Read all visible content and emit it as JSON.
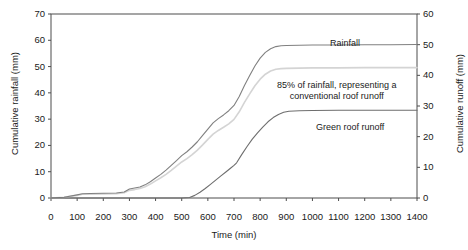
{
  "chart_data": {
    "type": "line",
    "title": "",
    "xlabel": "Time (min)",
    "ylabel": "Cumulative rainfall (mm)",
    "ylabel_right": "Cumulative runoff (mm)",
    "xlim": [
      0,
      1400
    ],
    "ylim": [
      0,
      70
    ],
    "ylim_right": [
      0,
      60
    ],
    "xticks": [
      0,
      100,
      200,
      300,
      400,
      500,
      600,
      700,
      800,
      900,
      1000,
      1100,
      1200,
      1300,
      1400
    ],
    "yticks": [
      0,
      10,
      20,
      30,
      40,
      50,
      60,
      70
    ],
    "yticks_right": [
      0,
      10,
      20,
      30,
      40,
      50,
      60
    ],
    "grid": false,
    "legend_position": "inline-annotations",
    "series": [
      {
        "name": "Rainfall",
        "color": "#808080",
        "axis": "left",
        "x": [
          0,
          50,
          100,
          120,
          150,
          200,
          250,
          280,
          300,
          320,
          340,
          360,
          380,
          400,
          420,
          440,
          460,
          480,
          500,
          520,
          540,
          560,
          580,
          600,
          620,
          640,
          660,
          680,
          700,
          720,
          740,
          760,
          780,
          800,
          820,
          840,
          860,
          880,
          900,
          950,
          1000,
          1100,
          1200,
          1300,
          1400
        ],
        "y": [
          0,
          0.3,
          1.2,
          1.6,
          1.7,
          1.8,
          1.9,
          2.3,
          3.4,
          3.8,
          4.2,
          5.0,
          6.2,
          7.6,
          9.0,
          10.6,
          12.4,
          14.2,
          16.1,
          17.6,
          19.4,
          21.4,
          23.8,
          26.2,
          28.6,
          30.2,
          31.6,
          33.2,
          35.2,
          38.6,
          42.8,
          46.6,
          50.2,
          53.2,
          55.4,
          56.8,
          57.6,
          57.9,
          58.0,
          58.1,
          58.2,
          58.2,
          58.3,
          58.3,
          58.4
        ]
      },
      {
        "name": "85% of rainfall, representing a conventional roof runoff",
        "color": "#d4d4d4",
        "axis": "left",
        "x": [
          0,
          50,
          100,
          120,
          150,
          200,
          250,
          280,
          300,
          320,
          340,
          360,
          380,
          400,
          420,
          440,
          460,
          480,
          500,
          520,
          540,
          560,
          580,
          600,
          620,
          640,
          660,
          680,
          700,
          720,
          740,
          760,
          780,
          800,
          820,
          840,
          860,
          880,
          900,
          950,
          1000,
          1100,
          1200,
          1300,
          1400
        ],
        "y": [
          0,
          0.25,
          1.0,
          1.4,
          1.45,
          1.5,
          1.6,
          2.0,
          2.9,
          3.2,
          3.6,
          4.3,
          5.3,
          6.5,
          7.7,
          9.0,
          10.5,
          12.1,
          13.7,
          15.0,
          16.5,
          18.2,
          20.2,
          22.3,
          24.3,
          25.7,
          26.9,
          28.2,
          29.9,
          32.8,
          36.4,
          39.6,
          42.7,
          45.2,
          47.1,
          48.3,
          49.0,
          49.2,
          49.3,
          49.4,
          49.5,
          49.5,
          49.6,
          49.6,
          49.6
        ]
      },
      {
        "name": "Green roof runoff",
        "color": "#6e6e6e",
        "axis": "left",
        "x": [
          0,
          100,
          200,
          300,
          400,
          500,
          530,
          550,
          570,
          590,
          610,
          630,
          650,
          670,
          690,
          700,
          710,
          730,
          750,
          770,
          790,
          810,
          830,
          850,
          870,
          890,
          910,
          950,
          1000,
          1100,
          1200,
          1300,
          1400
        ],
        "y": [
          0,
          0,
          0,
          0,
          0,
          0,
          0.2,
          1.0,
          2.2,
          3.6,
          5.2,
          6.8,
          8.4,
          10.0,
          11.6,
          12.4,
          13.4,
          16.6,
          19.6,
          22.4,
          24.8,
          27.0,
          29.0,
          30.6,
          31.8,
          32.6,
          33.0,
          33.2,
          33.3,
          33.4,
          33.4,
          33.4,
          33.4
        ]
      }
    ],
    "annotations": [
      {
        "text": "Rainfall",
        "x_px": 345,
        "y_px": 44
      },
      {
        "text_line1": "85% of rainfall, representing a",
        "text_line2": "conventional roof runoff",
        "x_px": 337,
        "y_px": 85
      },
      {
        "text": "Green roof runoff",
        "x_px": 350,
        "y_px": 128
      }
    ]
  },
  "axes": {
    "x_title": "Time (min)",
    "y_left_title": "Cumulative rainfall (mm)",
    "y_right_title": "Cumulative runoff (mm)",
    "x_ticks": [
      "0",
      "100",
      "200",
      "300",
      "400",
      "500",
      "600",
      "700",
      "800",
      "900",
      "1000",
      "1100",
      "1200",
      "1300",
      "1400"
    ],
    "y_left_ticks": [
      "70",
      "60",
      "50",
      "40",
      "30",
      "20",
      "10",
      "0"
    ],
    "y_right_ticks": [
      "60",
      "50",
      "40",
      "30",
      "20",
      "10",
      "0"
    ]
  },
  "annotations": {
    "rainfall": "Rainfall",
    "conventional_line1": "85% of rainfall, representing a",
    "conventional_line2": "conventional roof runoff",
    "green_roof": "Green roof runoff"
  },
  "colors": {
    "axis": "#4d4d4d",
    "rainfall": "#808080",
    "conventional": "#d4d4d4",
    "green_roof": "#6e6e6e",
    "text": "#1a1a1a"
  }
}
